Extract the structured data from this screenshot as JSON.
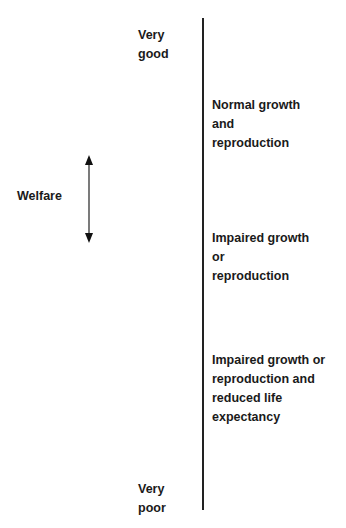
{
  "diagram": {
    "axis_label": "Welfare",
    "scale_top": "Very\ngood",
    "scale_bottom": "Very\npoor",
    "levels": [
      {
        "label": "Normal growth\nand\nreproduction"
      },
      {
        "label": "Impaired growth\nor\nreproduction"
      },
      {
        "label": "Impaired growth or\nreproduction and\nreduced life\nexpectancy"
      }
    ]
  }
}
